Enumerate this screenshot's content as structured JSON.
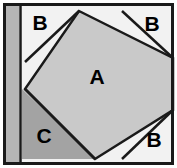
{
  "figure": {
    "canvas": {
      "width": 177,
      "height": 168
    },
    "frame": {
      "outer_margin_color": "#ffffff",
      "border_color": "#1a1a1a",
      "border_width": 3
    },
    "colors": {
      "region_a_fill": "#c9c9c9",
      "region_b_fill": "#f2f2f2",
      "region_c_fill": "#a3a3a3",
      "left_band_fill": "#b5b5b5",
      "stroke": "#1a1a1a",
      "label_color": "#000000",
      "background": "#ffffff"
    },
    "left_band": {
      "name": "left-vertical-band",
      "x": 5,
      "width": 14,
      "divider_stroke": "#1a1a1a"
    },
    "regions": [
      {
        "id": "A",
        "label": "A",
        "shape": "rotated-square",
        "fill": "#c9c9c9",
        "label_x": 97,
        "label_y": 78,
        "points": "79,11 173,58 173,110 95,159 25,89"
      },
      {
        "id": "B-top-left",
        "label": "B",
        "shape": "triangle",
        "fill": "#f2f2f2",
        "label_x": 40,
        "label_y": 23,
        "points": "22,11 79,11 25,62"
      },
      {
        "id": "B-top-right",
        "label": "B",
        "shape": "triangle",
        "fill": "#f2f2f2",
        "label_x": 152,
        "label_y": 24,
        "points": "122,11 173,11 173,58"
      },
      {
        "id": "B-bottom-right",
        "label": "B",
        "shape": "triangle",
        "fill": "#f2f2f2",
        "label_x": 154,
        "label_y": 140,
        "points": "173,110 173,159 122,159"
      },
      {
        "id": "C",
        "label": "C",
        "shape": "triangle",
        "fill": "#a3a3a3",
        "label_x": 44,
        "label_y": 136,
        "points": "22,89 95,159 22,159"
      }
    ]
  }
}
